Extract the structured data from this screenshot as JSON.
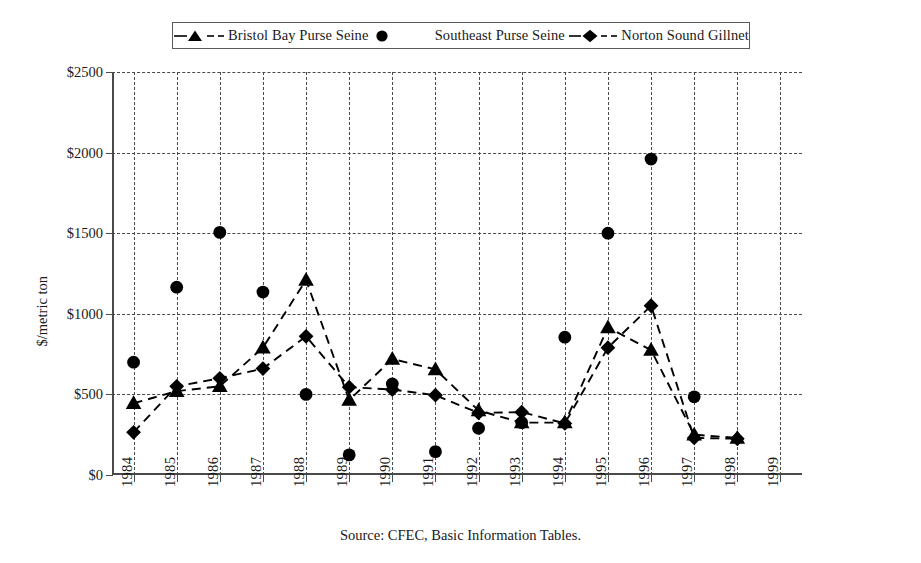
{
  "legend": {
    "entries": [
      {
        "label": "Bristol Bay Purse Seine",
        "key": "dashed-line-triangle-marker",
        "color": "#000000"
      },
      {
        "label": "Southeast Purse Seine",
        "key": "circle-marker",
        "color": "#000000"
      },
      {
        "label": "Norton Sound Gillnet",
        "key": "dashed-line-diamond-marker",
        "color": "#000000"
      }
    ]
  },
  "axis": {
    "y_title": "$/metric ton",
    "y_ticks": [
      "$0",
      "$500",
      "$1000",
      "$1500",
      "$2000",
      "$2500"
    ],
    "x_ticks": [
      "1984",
      "1985",
      "1986",
      "1987",
      "1988",
      "1989",
      "1990",
      "1991",
      "1992",
      "1993",
      "1994",
      "1995",
      "1996",
      "1997",
      "1998",
      "1999"
    ]
  },
  "source_note": "Source:  CFEC, Basic Information Tables.",
  "chart_data": {
    "type": "line",
    "title": "",
    "xlabel": "",
    "ylabel": "$/metric ton",
    "ylim": [
      0,
      2500
    ],
    "ytick_values": [
      0,
      500,
      1000,
      1500,
      2000,
      2500
    ],
    "grid": true,
    "legend_position": "top-center",
    "x": [
      1984,
      1985,
      1986,
      1987,
      1988,
      1989,
      1990,
      1991,
      1992,
      1993,
      1994,
      1995,
      1996,
      1997,
      1998,
      1999
    ],
    "series": [
      {
        "name": "Bristol Bay Purse Seine",
        "marker": "triangle",
        "line": "dashed",
        "color": "#000000",
        "values": [
          445,
          520,
          550,
          790,
          1210,
          465,
          720,
          655,
          400,
          325,
          325,
          915,
          775,
          250,
          230,
          null
        ]
      },
      {
        "name": "Southeast Purse Seine",
        "marker": "circle",
        "line": "none",
        "color": "#000000",
        "values": [
          700,
          1165,
          1505,
          1135,
          500,
          125,
          565,
          145,
          290,
          325,
          855,
          1500,
          1960,
          485,
          null,
          null
        ]
      },
      {
        "name": "Norton Sound Gillnet",
        "marker": "diamond",
        "line": "dashed",
        "color": "#000000",
        "values": [
          265,
          550,
          600,
          660,
          860,
          545,
          530,
          495,
          385,
          390,
          320,
          790,
          1050,
          230,
          225,
          null
        ]
      }
    ]
  }
}
